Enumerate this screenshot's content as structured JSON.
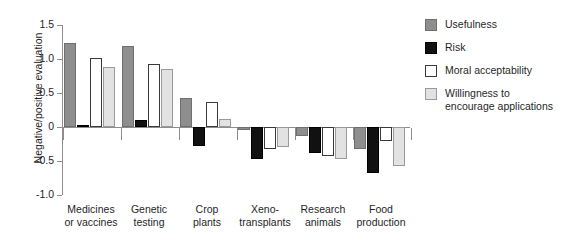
{
  "clipped_title_remnant": "",
  "chart_data": {
    "type": "bar",
    "title": "",
    "subtitle": "",
    "xlabel": "",
    "ylabel": "Negative/positive evaluation",
    "ylim": [
      -1.0,
      1.5
    ],
    "yticks": [
      "1.5",
      "1.0",
      "0.5",
      "0",
      "-0.5",
      "-1.0"
    ],
    "ytick_values": [
      1.5,
      1.0,
      0.5,
      0,
      -0.5,
      -1.0
    ],
    "grid": false,
    "legend_position": "right",
    "zero_reference_line": true,
    "categories": [
      "Medicines\nor vaccines",
      "Genetic\ntesting",
      "Crop\nplants",
      "Xeno-\ntransplants",
      "Research\nanimals",
      "Food\nproduction"
    ],
    "series": [
      {
        "name": "Usefulness",
        "color": "#8e8e8e",
        "values": [
          1.23,
          1.19,
          0.43,
          -0.04,
          -0.13,
          -0.33
        ]
      },
      {
        "name": "Risk",
        "color": "#111111",
        "values": [
          0.03,
          0.1,
          -0.28,
          -0.47,
          -0.38,
          -0.67
        ]
      },
      {
        "name": "Moral acceptability",
        "color": "#ffffff",
        "values": [
          1.02,
          0.92,
          0.37,
          -0.33,
          -0.43,
          -0.2
        ]
      },
      {
        "name": "Willingness to\nencourage applications",
        "color": "#e2e2e2",
        "values": [
          0.88,
          0.85,
          0.12,
          -0.3,
          -0.47,
          -0.57
        ]
      }
    ]
  },
  "legend": {
    "items": [
      {
        "label": "Usefulness",
        "swatch": "useful"
      },
      {
        "label": "Risk",
        "swatch": "risk"
      },
      {
        "label": "Moral acceptability",
        "swatch": "moral"
      },
      {
        "label": "Willingness to\nencourage applications",
        "swatch": "willing"
      }
    ]
  }
}
